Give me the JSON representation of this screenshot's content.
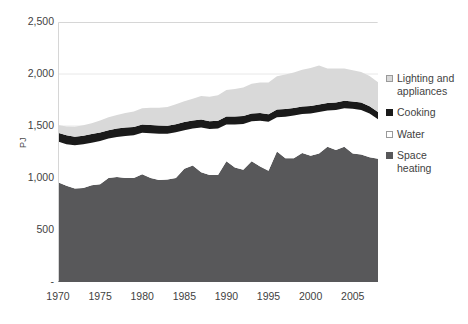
{
  "chart_data": {
    "type": "area",
    "title": "",
    "xlabel": "",
    "ylabel": "PJ",
    "ylim": [
      0,
      2500
    ],
    "xlim": [
      1970,
      2008
    ],
    "grid": false,
    "stacked": true,
    "legend_position": "right",
    "ytick_labels": [
      "2,500",
      "2,000",
      "1,500",
      "1,000",
      "500",
      "-"
    ],
    "ytick_values": [
      2500,
      2000,
      1500,
      1000,
      500,
      0
    ],
    "xtick_labels": [
      "1970",
      "1975",
      "1980",
      "1985",
      "1990",
      "1995",
      "2000",
      "2005"
    ],
    "xtick_values": [
      1970,
      1975,
      1980,
      1985,
      1990,
      1995,
      2000,
      2005
    ],
    "x": [
      1970,
      1971,
      1972,
      1973,
      1974,
      1975,
      1976,
      1977,
      1978,
      1979,
      1980,
      1981,
      1982,
      1983,
      1984,
      1985,
      1986,
      1987,
      1988,
      1989,
      1990,
      1991,
      1992,
      1993,
      1994,
      1995,
      1996,
      1997,
      1998,
      1999,
      2000,
      2001,
      2002,
      2003,
      2004,
      2005,
      2006,
      2007,
      2008
    ],
    "series": [
      {
        "name": "Space heating",
        "color": "#58585a",
        "values": [
          960,
          925,
          900,
          905,
          930,
          940,
          1000,
          1010,
          1000,
          1000,
          1035,
          1000,
          980,
          985,
          1000,
          1090,
          1120,
          1055,
          1030,
          1030,
          1160,
          1100,
          1080,
          1160,
          1110,
          1070,
          1255,
          1190,
          1190,
          1240,
          1215,
          1235,
          1300,
          1270,
          1300,
          1235,
          1225,
          1200,
          1185
        ]
      },
      {
        "name": "Water",
        "color": "#ffffff",
        "values": [
          390,
          400,
          415,
          420,
          410,
          415,
          380,
          385,
          405,
          410,
          400,
          430,
          445,
          440,
          440,
          370,
          355,
          430,
          440,
          445,
          355,
          415,
          440,
          385,
          440,
          470,
          330,
          400,
          410,
          375,
          405,
          400,
          350,
          385,
          370,
          430,
          430,
          420,
          380
        ]
      },
      {
        "name": "Cooking",
        "color": "#1a1a1a",
        "values": [
          85,
          85,
          82,
          82,
          82,
          82,
          80,
          80,
          80,
          80,
          80,
          80,
          80,
          78,
          78,
          78,
          78,
          78,
          76,
          76,
          76,
          76,
          76,
          76,
          74,
          74,
          74,
          74,
          74,
          72,
          72,
          72,
          72,
          72,
          72,
          70,
          70,
          70,
          70
        ]
      },
      {
        "name": "Lighting and appliances",
        "color": "#d9d9d9",
        "values": [
          75,
          85,
          95,
          100,
          105,
          115,
          125,
          130,
          140,
          150,
          155,
          165,
          170,
          180,
          190,
          200,
          210,
          225,
          235,
          245,
          255,
          265,
          275,
          285,
          295,
          305,
          320,
          330,
          340,
          355,
          365,
          375,
          330,
          325,
          310,
          300,
          295,
          290,
          285
        ]
      }
    ]
  },
  "legend": {
    "items": [
      {
        "label": "Lighting and\nappliances",
        "swatch_name": "legend-swatch-lighting",
        "color": "#d9d9d9",
        "border": "#9a9a9a"
      },
      {
        "label": "Cooking",
        "swatch_name": "legend-swatch-cooking",
        "color": "#1a1a1a",
        "border": "#1a1a1a"
      },
      {
        "label": "Water",
        "swatch_name": "legend-swatch-water",
        "color": "#ffffff",
        "border": "#9a9a9a"
      },
      {
        "label": "Space\nheating",
        "swatch_name": "legend-swatch-space-heating",
        "color": "#58585a",
        "border": "#58585a"
      }
    ]
  },
  "colors": {
    "space_heating": "#58585a",
    "water": "#ffffff",
    "cooking": "#1a1a1a",
    "lighting": "#d9d9d9",
    "text": "#3f3f3f",
    "grid": "#e8e8e8",
    "background": "#ffffff"
  }
}
